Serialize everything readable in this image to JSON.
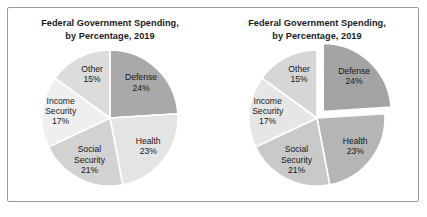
{
  "figure": {
    "background_color": "#ffffff",
    "frame_color": "#9a9a9a"
  },
  "panels": [
    {
      "id": "pie-standard",
      "title": "Federal Government Spending,\nby Percentage, 2019",
      "exploded": false
    },
    {
      "id": "pie-exploded",
      "title": "Federal Government Spending,\nby Percentage, 2019",
      "exploded": true,
      "exploded_slice": "Defense"
    }
  ],
  "chart_data": [
    {
      "type": "pie",
      "title": "Federal Government Spending, by Percentage, 2019",
      "xlabel": "",
      "ylabel": "",
      "start_angle_deg": 0,
      "direction": "clockwise",
      "exploded": false,
      "categories": [
        "Defense",
        "Health",
        "Social Security",
        "Income Security",
        "Other"
      ],
      "values": [
        24,
        23,
        21,
        17,
        15
      ],
      "value_unit": "percent",
      "labels": [
        {
          "name": "Defense",
          "pct": "24%"
        },
        {
          "name": "Health",
          "pct": "23%"
        },
        {
          "name": "Social Security",
          "pct": "21%"
        },
        {
          "name": "Income Security",
          "pct": "17%"
        },
        {
          "name": "Other",
          "pct": "15%"
        }
      ],
      "colors": [
        "#a9a9a9",
        "#e4e4e4",
        "#d2d2d2",
        "#efefef",
        "#dcdcdc"
      ],
      "separator_color": "#ffffff",
      "legend": "none",
      "grid": false
    },
    {
      "type": "pie",
      "title": "Federal Government Spending, by Percentage, 2019",
      "xlabel": "",
      "ylabel": "",
      "start_angle_deg": 0,
      "direction": "clockwise",
      "exploded": true,
      "exploded_slice": "Defense",
      "categories": [
        "Defense",
        "Health",
        "Social Security",
        "Income Security",
        "Other"
      ],
      "values": [
        24,
        23,
        21,
        17,
        15
      ],
      "value_unit": "percent",
      "labels": [
        {
          "name": "Defense",
          "pct": "24%"
        },
        {
          "name": "Health",
          "pct": "23%"
        },
        {
          "name": "Social Security",
          "pct": "21%"
        },
        {
          "name": "Income Security",
          "pct": "17%"
        },
        {
          "name": "Other",
          "pct": "15%"
        }
      ],
      "colors": [
        "#a3a3a3",
        "#b5b5b5",
        "#c9c9c9",
        "#e6e6e6",
        "#d6d6d6"
      ],
      "separator_color": "#ffffff",
      "legend": "none",
      "grid": false
    }
  ]
}
